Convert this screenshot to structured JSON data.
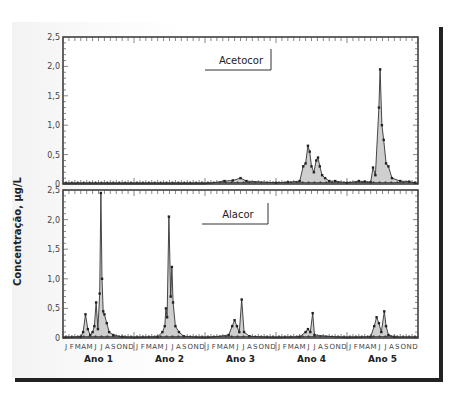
{
  "ylabel": "Concentração, µg/L",
  "panels": [
    {
      "name": "Acetocor",
      "label": "Acetocor"
    },
    {
      "name": "Alacor",
      "label": "Alacor"
    }
  ],
  "yticks": [
    "0",
    "0,5",
    "1,0",
    "1,5",
    "2,0",
    "2,5"
  ],
  "month_letters": [
    "J",
    "F",
    "M",
    "A",
    "M",
    "J",
    "J",
    "A",
    "S",
    "O",
    "N",
    "D"
  ],
  "years": [
    "Ano 1",
    "Ano 2",
    "Ano 3",
    "Ano 4",
    "Ano 5"
  ],
  "chart_data": [
    {
      "type": "area",
      "title": "Acetocor",
      "xlabel": "",
      "ylabel": "Concentração, µg/L",
      "ylim": [
        0,
        2.5
      ],
      "x_categories": [
        "Ano 1",
        "Ano 2",
        "Ano 3",
        "Ano 4",
        "Ano 5"
      ],
      "x_unit": "month index (0 = Jan Ano 1)",
      "series": [
        {
          "name": "Acetocor",
          "points": [
            [
              0,
              0
            ],
            [
              24,
              0
            ],
            [
              27.3,
              0.05
            ],
            [
              28.7,
              0.06
            ],
            [
              30,
              0.1
            ],
            [
              31,
              0.05
            ],
            [
              36,
              0.02
            ],
            [
              38,
              0.03
            ],
            [
              40,
              0.05
            ],
            [
              40.6,
              0.3
            ],
            [
              41,
              0.35
            ],
            [
              41.4,
              0.65
            ],
            [
              41.7,
              0.55
            ],
            [
              42,
              0.3
            ],
            [
              42.4,
              0.2
            ],
            [
              42.8,
              0.4
            ],
            [
              43.1,
              0.45
            ],
            [
              43.4,
              0.3
            ],
            [
              43.8,
              0.15
            ],
            [
              44.3,
              0.1
            ],
            [
              45,
              0.05
            ],
            [
              46,
              0.05
            ],
            [
              48,
              0.02
            ],
            [
              50,
              0.05
            ],
            [
              51,
              0.04
            ],
            [
              52,
              0.03
            ],
            [
              52.4,
              0.28
            ],
            [
              52.8,
              0.15
            ],
            [
              53.4,
              1.3
            ],
            [
              53.6,
              1.95
            ],
            [
              53.9,
              1.0
            ],
            [
              54.2,
              0.75
            ],
            [
              54.6,
              0.35
            ],
            [
              55.0,
              0.3
            ],
            [
              55.6,
              0.1
            ],
            [
              57,
              0.05
            ],
            [
              58.5,
              0.04
            ],
            [
              59.5,
              0.02
            ]
          ]
        }
      ],
      "annotations": [
        "Acetocor"
      ]
    },
    {
      "type": "area",
      "title": "Alacor",
      "xlabel": "",
      "ylabel": "Concentração, µg/L",
      "ylim": [
        0,
        2.5
      ],
      "x_categories": [
        "Ano 1",
        "Ano 2",
        "Ano 3",
        "Ano 4",
        "Ano 5"
      ],
      "x_unit": "month index (0 = Jan Ano 1)",
      "series": [
        {
          "name": "Alacor",
          "points": [
            [
              0,
              0
            ],
            [
              3,
              0.02
            ],
            [
              3.4,
              0.1
            ],
            [
              3.8,
              0.4
            ],
            [
              4.2,
              0.15
            ],
            [
              4.6,
              0.05
            ],
            [
              5,
              0.1
            ],
            [
              5.3,
              0.2
            ],
            [
              5.6,
              0.6
            ],
            [
              5.9,
              0.15
            ],
            [
              6.2,
              0.75
            ],
            [
              6.4,
              2.45
            ],
            [
              6.6,
              1.0
            ],
            [
              6.8,
              0.45
            ],
            [
              7,
              0.4
            ],
            [
              7.4,
              0.25
            ],
            [
              7.8,
              0.1
            ],
            [
              8.5,
              0.05
            ],
            [
              10,
              0.02
            ],
            [
              12,
              0
            ],
            [
              16,
              0.02
            ],
            [
              16.8,
              0.1
            ],
            [
              17.2,
              0.2
            ],
            [
              17.4,
              0.5
            ],
            [
              17.6,
              0.35
            ],
            [
              17.9,
              2.05
            ],
            [
              18.2,
              0.7
            ],
            [
              18.4,
              1.2
            ],
            [
              18.6,
              0.6
            ],
            [
              19,
              0.2
            ],
            [
              19.6,
              0.1
            ],
            [
              20.4,
              0.03
            ],
            [
              24,
              0
            ],
            [
              28,
              0.05
            ],
            [
              28.6,
              0.2
            ],
            [
              29.0,
              0.3
            ],
            [
              29.4,
              0.2
            ],
            [
              29.8,
              0.1
            ],
            [
              30.2,
              0.65
            ],
            [
              30.6,
              0.1
            ],
            [
              31.5,
              0.03
            ],
            [
              36,
              0
            ],
            [
              40,
              0.02
            ],
            [
              41.0,
              0.1
            ],
            [
              41.4,
              0.15
            ],
            [
              41.8,
              0.1
            ],
            [
              42.2,
              0.42
            ],
            [
              42.5,
              0.05
            ],
            [
              48,
              0
            ],
            [
              52,
              0.02
            ],
            [
              52.6,
              0.2
            ],
            [
              53,
              0.35
            ],
            [
              53.4,
              0.25
            ],
            [
              53.8,
              0.1
            ],
            [
              54.3,
              0.45
            ],
            [
              54.6,
              0.2
            ],
            [
              55,
              0.05
            ],
            [
              56,
              0.02
            ]
          ]
        }
      ],
      "annotations": [
        "Alacor"
      ]
    }
  ]
}
